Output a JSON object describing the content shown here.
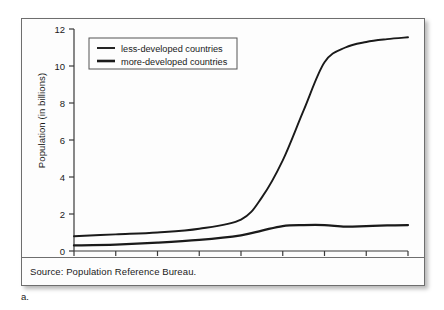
{
  "figure": {
    "caption_label": "a.",
    "source_note": "Source: Population Reference Bureau."
  },
  "colors": {
    "line": "#1a1a1a",
    "axis": "#3a3a3a",
    "frame": "#6e6e6e",
    "background": "#fdfdfd",
    "legend_border": "#555555"
  },
  "chart_data": {
    "type": "line",
    "title": "",
    "xlabel": "",
    "ylabel": "Population (in billions)",
    "xlim": [
      1750,
      2150
    ],
    "ylim": [
      0,
      12
    ],
    "grid": false,
    "legend_position": "upper-left",
    "xticks": [
      1750,
      1800,
      1850,
      1900,
      1950,
      2000,
      2050,
      2100,
      2150
    ],
    "yticks": [
      0,
      2,
      4,
      6,
      8,
      10,
      12
    ],
    "x": [
      1750,
      1800,
      1850,
      1900,
      1950,
      1975,
      2000,
      2025,
      2050,
      2075,
      2100,
      2125,
      2150
    ],
    "series": [
      {
        "name": "less-developed countries",
        "values": [
          0.8,
          0.9,
          1.0,
          1.2,
          1.7,
          2.9,
          4.9,
          7.6,
          10.2,
          11.0,
          11.3,
          11.45,
          11.55
        ]
      },
      {
        "name": "more-developed countries",
        "values": [
          0.3,
          0.35,
          0.45,
          0.6,
          0.85,
          1.1,
          1.35,
          1.4,
          1.4,
          1.32,
          1.35,
          1.38,
          1.4
        ]
      }
    ]
  },
  "legend": {
    "items": [
      {
        "label": "less-developed countries"
      },
      {
        "label": "more-developed countries"
      }
    ]
  }
}
